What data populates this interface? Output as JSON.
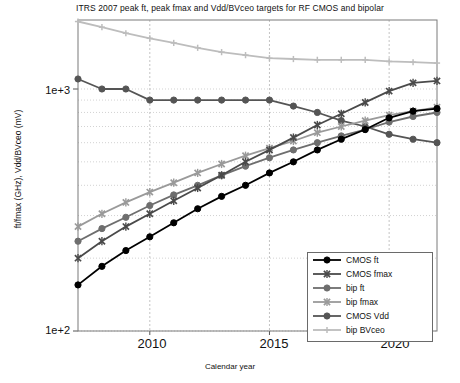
{
  "title": "ITRS 2007 peak ft, peak fmax and Vdd/BVceo targets for RF CMOS and bipolar",
  "axes": {
    "xlabel": "Calendar year",
    "ylabel": "ft/fmax (GHz), Vdd/BVceo (mV)",
    "yticks": [
      "1e+3",
      "1e+2"
    ],
    "xticks": [
      "2010",
      "2015",
      "2020"
    ]
  },
  "legend": {
    "items": [
      {
        "label": "CMOS ft",
        "color": "#000000",
        "marker": "circle"
      },
      {
        "label": "CMOS fmax",
        "color": "#4a4a4a",
        "marker": "x"
      },
      {
        "label": "bip ft",
        "color": "#6e6e6e",
        "marker": "circle"
      },
      {
        "label": "bip fmax",
        "color": "#9a9a9a",
        "marker": "x"
      },
      {
        "label": "CMOS Vdd",
        "color": "#555555",
        "marker": "circle"
      },
      {
        "label": "bip BVceo",
        "color": "#bdbdbd",
        "marker": "plus"
      }
    ]
  },
  "chart_data": {
    "type": "line",
    "title": "ITRS 2007 peak ft, peak fmax and Vdd/BVceo targets for RF CMOS and bipolar",
    "xlabel": "Calendar year",
    "ylabel": "ft/fmax (GHz), Vdd/BVceo (mV)",
    "yscale": "log",
    "ylim": [
      100,
      2000
    ],
    "xlim": [
      2007,
      2022
    ],
    "grid": true,
    "legend_position": "lower-right",
    "x": [
      2007,
      2008,
      2009,
      2010,
      2011,
      2012,
      2013,
      2014,
      2015,
      2016,
      2017,
      2018,
      2019,
      2020,
      2021,
      2022
    ],
    "series": [
      {
        "name": "CMOS ft",
        "color": "#000000",
        "marker": "circle",
        "values": [
          155,
          185,
          215,
          245,
          280,
          320,
          360,
          400,
          450,
          500,
          560,
          620,
          680,
          760,
          810,
          830
        ]
      },
      {
        "name": "CMOS fmax",
        "color": "#4a4a4a",
        "marker": "x",
        "values": [
          200,
          235,
          270,
          305,
          345,
          390,
          440,
          500,
          560,
          630,
          710,
          790,
          880,
          980,
          1060,
          1080
        ]
      },
      {
        "name": "bip ft",
        "color": "#6e6e6e",
        "marker": "circle",
        "values": [
          235,
          265,
          295,
          330,
          365,
          400,
          440,
          480,
          520,
          560,
          600,
          640,
          680,
          730,
          770,
          800
        ]
      },
      {
        "name": "bip fmax",
        "color": "#9a9a9a",
        "marker": "x",
        "values": [
          270,
          305,
          340,
          375,
          410,
          450,
          490,
          530,
          570,
          610,
          660,
          700,
          740,
          780,
          810,
          840
        ]
      },
      {
        "name": "CMOS Vdd",
        "color": "#555555",
        "marker": "circle",
        "values": [
          1100,
          1000,
          1000,
          900,
          900,
          900,
          900,
          900,
          900,
          850,
          800,
          740,
          700,
          650,
          620,
          600
        ]
      },
      {
        "name": "bip BVceo",
        "color": "#bdbdbd",
        "marker": "plus",
        "values": [
          1900,
          1800,
          1700,
          1620,
          1550,
          1480,
          1420,
          1380,
          1340,
          1330,
          1320,
          1320,
          1320,
          1300,
          1290,
          1280
        ]
      }
    ]
  }
}
